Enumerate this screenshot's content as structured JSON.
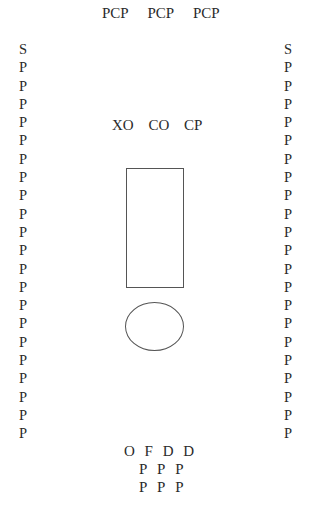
{
  "top_labels": [
    "PCP",
    "PCP",
    "PCP"
  ],
  "left_column": [
    "S",
    "P",
    "P",
    "P",
    "P",
    "P",
    "P",
    "P",
    "P",
    "P",
    "P",
    "P",
    "P",
    "P",
    "P",
    "P",
    "P",
    "P",
    "P",
    "P",
    "P",
    "P"
  ],
  "right_column": [
    "S",
    "P",
    "P",
    "P",
    "P",
    "P",
    "P",
    "P",
    "P",
    "P",
    "P",
    "P",
    "P",
    "P",
    "P",
    "P",
    "P",
    "P",
    "P",
    "P",
    "P",
    "P"
  ],
  "middle_labels": [
    "XO",
    "CO",
    "CP"
  ],
  "shapes": {
    "rectangle": {
      "stroke": "#555555"
    },
    "ellipse": {
      "stroke": "#555555"
    }
  },
  "bottom_rows": [
    [
      "O",
      "F",
      "D",
      "D"
    ],
    [
      "P",
      "P",
      "P"
    ],
    [
      "P",
      "P",
      "P"
    ]
  ]
}
